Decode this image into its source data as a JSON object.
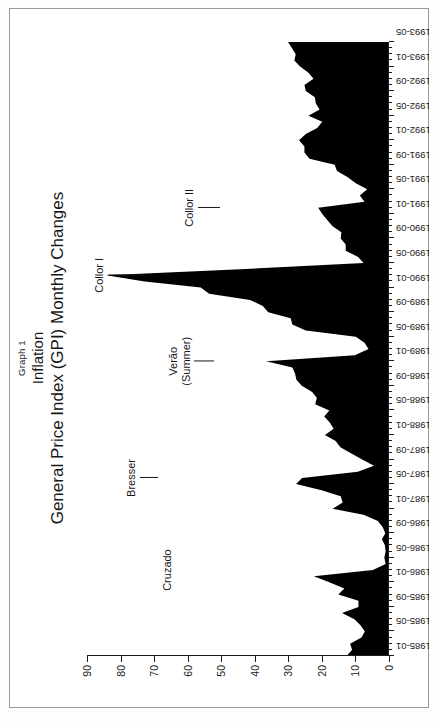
{
  "figure": {
    "graph_number": "Graph 1",
    "subject": "Inflation",
    "title": "General Price Index (GPI) Monthly Changes"
  },
  "axes": {
    "value_axis": {
      "ticks": [
        "0",
        "10",
        "20",
        "30",
        "40",
        "50",
        "60",
        "70",
        "80",
        "90"
      ],
      "min": 0,
      "max": 90,
      "step": 10
    },
    "date_axis": {
      "ticks": [
        "1985-01",
        "1985-05",
        "1985-09",
        "1986-01",
        "1986-05",
        "1986-09",
        "1987-01",
        "1987-05",
        "1987-09",
        "1988-01",
        "1988-05",
        "1988-09",
        "1989-01",
        "1989-05",
        "1989-09",
        "1990-01",
        "1990-05",
        "1990-09",
        "1991-01",
        "1991-05",
        "1991-09",
        "1992-01",
        "1992-05",
        "1992-09",
        "1993-01",
        "1993-05"
      ],
      "start": "1985-01",
      "end": "1993-05"
    }
  },
  "annotations": [
    {
      "id": "cruzado",
      "label": "Cruzado",
      "lines": [
        "Cruzado"
      ],
      "at": "1986-03"
    },
    {
      "id": "bresser",
      "label": "Bresser",
      "lines": [
        "Bresser"
      ],
      "at": "1987-06"
    },
    {
      "id": "verao",
      "label": "Verão (Summer)",
      "lines": [
        "Verão",
        "(Summer)"
      ],
      "at": "1989-01"
    },
    {
      "id": "collor-1",
      "label": "Collor I",
      "lines": [
        "Collor I"
      ],
      "at": "1990-03"
    },
    {
      "id": "collor-2",
      "label": "Collor II",
      "lines": [
        "Collor II"
      ],
      "at": "1991-02"
    }
  ],
  "colors": {
    "ink": "#17171a",
    "area_fill": "#000000",
    "page": "#ffffff",
    "frame": "#9a9a95"
  },
  "chart_data": {
    "type": "area",
    "title": "General Price Index (GPI) Monthly Changes",
    "subtitle": "Inflation",
    "xlabel": "",
    "ylabel": "",
    "ylim": [
      0,
      90
    ],
    "grid": false,
    "legend": null,
    "x": [
      "1985-01",
      "1985-02",
      "1985-03",
      "1985-04",
      "1985-05",
      "1985-06",
      "1985-07",
      "1985-08",
      "1985-09",
      "1985-10",
      "1985-11",
      "1985-12",
      "1986-01",
      "1986-02",
      "1986-03",
      "1986-04",
      "1986-05",
      "1986-06",
      "1986-07",
      "1986-08",
      "1986-09",
      "1986-10",
      "1986-11",
      "1986-12",
      "1987-01",
      "1987-02",
      "1987-03",
      "1987-04",
      "1987-05",
      "1987-06",
      "1987-07",
      "1987-08",
      "1987-09",
      "1987-10",
      "1987-11",
      "1987-12",
      "1988-01",
      "1988-02",
      "1988-03",
      "1988-04",
      "1988-05",
      "1988-06",
      "1988-07",
      "1988-08",
      "1988-09",
      "1988-10",
      "1988-11",
      "1988-12",
      "1989-01",
      "1989-02",
      "1989-03",
      "1989-04",
      "1989-05",
      "1989-06",
      "1989-07",
      "1989-08",
      "1989-09",
      "1989-10",
      "1989-11",
      "1989-12",
      "1990-01",
      "1990-02",
      "1990-03",
      "1990-04",
      "1990-05",
      "1990-06",
      "1990-07",
      "1990-08",
      "1990-09",
      "1990-10",
      "1990-11",
      "1990-12",
      "1991-01",
      "1991-02",
      "1991-03",
      "1991-04",
      "1991-05",
      "1991-06",
      "1991-07",
      "1991-08",
      "1991-09",
      "1991-10",
      "1991-11",
      "1991-12",
      "1992-01",
      "1992-02",
      "1992-03",
      "1992-04",
      "1992-05",
      "1992-06",
      "1992-07",
      "1992-08",
      "1992-09",
      "1992-10",
      "1992-11",
      "1992-12",
      "1993-01",
      "1993-02",
      "1993-03",
      "1993-04",
      "1993-05"
    ],
    "values": [
      12.6,
      11.0,
      11.6,
      8.2,
      7.2,
      8.5,
      10.3,
      14.0,
      9.1,
      9.1,
      15.1,
      13.3,
      17.8,
      22.4,
      4.8,
      1.0,
      1.4,
      1.0,
      1.2,
      2.1,
      1.1,
      1.9,
      3.3,
      7.6,
      16.8,
      13.8,
      14.4,
      20.1,
      27.7,
      25.9,
      9.3,
      4.5,
      8.0,
      11.2,
      14.5,
      15.9,
      19.1,
      16.5,
      17.6,
      19.3,
      17.8,
      22.0,
      21.5,
      22.9,
      26.0,
      27.6,
      28.0,
      28.8,
      36.6,
      10.2,
      6.1,
      7.3,
      9.9,
      24.8,
      28.8,
      29.3,
      36.0,
      37.6,
      41.4,
      53.6,
      56.1,
      72.8,
      84.3,
      44.3,
      7.6,
      9.2,
      12.9,
      12.9,
      14.4,
      14.2,
      16.8,
      18.4,
      19.9,
      21.1,
      7.3,
      8.7,
      6.5,
      9.9,
      12.4,
      15.5,
      16.2,
      23.7,
      25.2,
      25.2,
      26.8,
      24.8,
      21.4,
      19.9,
      24.0,
      20.7,
      21.8,
      22.1,
      24.8,
      25.2,
      22.5,
      24.0,
      26.5,
      28.2,
      27.8,
      28.9,
      30.1
    ]
  }
}
